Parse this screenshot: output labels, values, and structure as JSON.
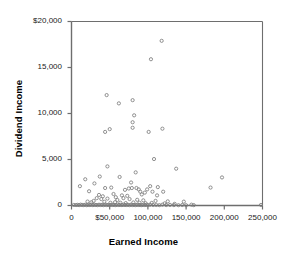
{
  "chart_data": {
    "type": "scatter",
    "title": "",
    "xlabel": "Earned Income",
    "ylabel": "Dividend Income",
    "xlim": [
      0,
      250000
    ],
    "ylim": [
      0,
      20000
    ],
    "grid": false,
    "legend": null,
    "marker": {
      "shape": "open-circle",
      "size": 3.2,
      "stroke": "#7d7d7d",
      "fill": "none"
    },
    "axis_color": "#6e6e6e",
    "text_color": "#1a1a1a",
    "xticks": [
      0,
      50000,
      100000,
      150000,
      200000,
      250000
    ],
    "xticklabels": [
      "0",
      "$50,000",
      "100,000",
      "150,000",
      "200,000",
      "250,000"
    ],
    "yticks": [
      0,
      5000,
      10000,
      15000,
      20000
    ],
    "yticklabels": [
      "0",
      "5,000",
      "10,000",
      "15,000",
      "$20,000"
    ],
    "points": [
      [
        118000,
        17900
      ],
      [
        104000,
        15900
      ],
      [
        46000,
        12000
      ],
      [
        62000,
        11100
      ],
      [
        80000,
        11450
      ],
      [
        82000,
        9800
      ],
      [
        80000,
        9050
      ],
      [
        80000,
        8450
      ],
      [
        44000,
        8000
      ],
      [
        50000,
        8300
      ],
      [
        101000,
        8000
      ],
      [
        119000,
        8350
      ],
      [
        108000,
        5050
      ],
      [
        137000,
        4000
      ],
      [
        47000,
        4250
      ],
      [
        84000,
        3600
      ],
      [
        197000,
        3050
      ],
      [
        37000,
        3150
      ],
      [
        63000,
        3100
      ],
      [
        18000,
        2850
      ],
      [
        11000,
        2100
      ],
      [
        30000,
        2400
      ],
      [
        78000,
        2500
      ],
      [
        103000,
        2100
      ],
      [
        113000,
        2000
      ],
      [
        182000,
        1950
      ],
      [
        23000,
        1550
      ],
      [
        44000,
        1900
      ],
      [
        52000,
        1950
      ],
      [
        70000,
        1700
      ],
      [
        75000,
        1850
      ],
      [
        79000,
        1900
      ],
      [
        85000,
        1900
      ],
      [
        88000,
        1750
      ],
      [
        90000,
        1500
      ],
      [
        96000,
        1400
      ],
      [
        99000,
        1750
      ],
      [
        106000,
        1500
      ],
      [
        120000,
        1500
      ],
      [
        36000,
        1150
      ],
      [
        41000,
        1000
      ],
      [
        55000,
        1250
      ],
      [
        58000,
        900
      ],
      [
        66000,
        1100
      ],
      [
        73000,
        1050
      ],
      [
        92000,
        1200
      ],
      [
        112000,
        1100
      ],
      [
        33000,
        800
      ],
      [
        39000,
        700
      ],
      [
        47000,
        750
      ],
      [
        60000,
        600
      ],
      [
        68000,
        800
      ],
      [
        76000,
        700
      ],
      [
        86000,
        620
      ],
      [
        94000,
        560
      ],
      [
        110000,
        500
      ],
      [
        126000,
        450
      ],
      [
        147000,
        420
      ],
      [
        29000,
        500
      ],
      [
        21000,
        430
      ],
      [
        26000,
        350
      ],
      [
        43000,
        400
      ],
      [
        51000,
        300
      ],
      [
        57000,
        360
      ],
      [
        64000,
        300
      ],
      [
        71000,
        260
      ],
      [
        81000,
        330
      ],
      [
        89000,
        300
      ],
      [
        97000,
        250
      ],
      [
        105000,
        280
      ],
      [
        122000,
        230
      ],
      [
        135000,
        180
      ],
      [
        157000,
        90
      ],
      [
        3000,
        60
      ],
      [
        6000,
        50
      ],
      [
        8000,
        70
      ],
      [
        10000,
        40
      ],
      [
        12000,
        90
      ],
      [
        14000,
        55
      ],
      [
        16000,
        45
      ],
      [
        18000,
        80
      ],
      [
        20000,
        35
      ],
      [
        22000,
        65
      ],
      [
        24000,
        50
      ],
      [
        26000,
        95
      ],
      [
        28000,
        40
      ],
      [
        30000,
        75
      ],
      [
        32000,
        60
      ],
      [
        34000,
        45
      ],
      [
        36000,
        85
      ],
      [
        38000,
        55
      ],
      [
        40000,
        70
      ],
      [
        42000,
        40
      ],
      [
        44000,
        90
      ],
      [
        46000,
        50
      ],
      [
        48000,
        65
      ],
      [
        50000,
        45
      ],
      [
        52000,
        80
      ],
      [
        54000,
        55
      ],
      [
        56000,
        60
      ],
      [
        58000,
        40
      ],
      [
        60000,
        95
      ],
      [
        62000,
        50
      ],
      [
        64000,
        70
      ],
      [
        66000,
        45
      ],
      [
        68000,
        85
      ],
      [
        70000,
        55
      ],
      [
        72000,
        60
      ],
      [
        74000,
        75
      ],
      [
        76000,
        40
      ],
      [
        78000,
        90
      ],
      [
        80000,
        50
      ],
      [
        82000,
        65
      ],
      [
        84000,
        45
      ],
      [
        86000,
        80
      ],
      [
        88000,
        55
      ],
      [
        90000,
        60
      ],
      [
        92000,
        40
      ],
      [
        94000,
        75
      ],
      [
        96000,
        50
      ],
      [
        98000,
        70
      ],
      [
        100000,
        45
      ],
      [
        103000,
        85
      ],
      [
        107000,
        55
      ],
      [
        111000,
        60
      ],
      [
        115000,
        40
      ],
      [
        119000,
        90
      ],
      [
        124000,
        50
      ],
      [
        129000,
        65
      ],
      [
        134000,
        45
      ],
      [
        140000,
        35
      ],
      [
        145000,
        55
      ],
      [
        150000,
        30
      ],
      [
        160000,
        40
      ],
      [
        248000,
        60
      ]
    ]
  }
}
